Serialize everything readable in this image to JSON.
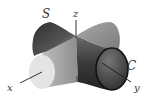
{
  "figure": {
    "labels": {
      "surface_s": "S",
      "surface_c": "C",
      "axis_x": "x",
      "axis_y": "y",
      "axis_z": "z"
    },
    "colors": {
      "dark_shade": "#3a3a3a",
      "mid_shade": "#8a8a8a",
      "light_shade": "#d8d8d8",
      "end_cap_light": "#e8e8e8",
      "axis": "#333333",
      "background": "#ffffff"
    }
  }
}
